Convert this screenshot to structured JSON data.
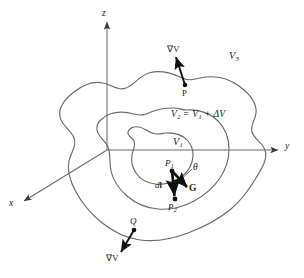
{
  "figure": {
    "type": "vector-field-gradient-diagram",
    "colors": {
      "contour": "#6b6b6b",
      "axis": "#6b6b6b",
      "vector": "#111111",
      "text": "#1a1a1a",
      "background": "#ffffff"
    }
  },
  "axes": {
    "z": {
      "label": "z"
    },
    "y": {
      "label": "y"
    },
    "x": {
      "label": "x"
    }
  },
  "surfaces": [
    {
      "id": "inner",
      "label": "V",
      "sub": "1",
      "full": "V1"
    },
    {
      "id": "middle",
      "label_parts": [
        "V",
        "2",
        " = ",
        "V",
        "1",
        " + ΔV"
      ],
      "full": "V2 = V1 + ΔV"
    },
    {
      "id": "outer",
      "label": "V",
      "sub": "3",
      "full": "V3"
    }
  ],
  "labels": {
    "v1": {
      "base": "V",
      "sub": "1"
    },
    "v3": {
      "base": "V",
      "sub": "3"
    },
    "v2_eq": {
      "v": "V",
      "sub2": "2",
      "eq": "=",
      "sub1": "1",
      "plus": "+",
      "delta": "ΔV"
    },
    "grad_top": "∇V",
    "grad_bottom": "∇V",
    "point_p": "P",
    "point_q": "Q",
    "point_p1": {
      "base": "P",
      "sub": "1"
    },
    "point_p2": {
      "base": "P",
      "sub": "2"
    },
    "dl": {
      "d": "d",
      "l": "l"
    },
    "g_vector": "G",
    "theta": "θ"
  },
  "vectors": [
    {
      "name": "grad-v-at-p",
      "label": "∇V",
      "from": "P",
      "direction": "outward-normal-up"
    },
    {
      "name": "grad-v-at-q",
      "label": "∇V",
      "from": "Q",
      "direction": "outward-normal-down-left"
    },
    {
      "name": "dl-vector",
      "label": "dl",
      "from": "P1",
      "to": "P2"
    },
    {
      "name": "g-vector",
      "label": "G",
      "from": "P1",
      "direction": "down-right"
    }
  ],
  "annotations": [
    {
      "name": "angle-theta",
      "label": "θ",
      "between": [
        "dl",
        "G"
      ]
    }
  ]
}
